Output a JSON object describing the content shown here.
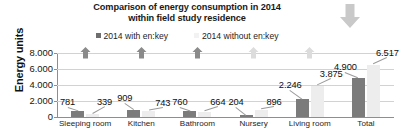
{
  "chart_data": {
    "type": "bar",
    "title": "Comparison of energy consumption in 2014 within field study residence",
    "title_line1": "Comparison of energy consumption in 2014",
    "title_line2": "within field study residence",
    "xlabel": "",
    "ylabel": "Energy units",
    "ylim": [
      0,
      8000
    ],
    "grid": true,
    "legend_position": "top-center",
    "categories": [
      "Sleeping room",
      "Kitchen",
      "Bathroom",
      "Nursery",
      "Living room",
      "Total"
    ],
    "ytick_labels": [
      "0",
      "2.000",
      "4.000",
      "6.000",
      "8.000"
    ],
    "ytick_values": [
      0,
      2000,
      4000,
      6000,
      8000
    ],
    "series": [
      {
        "name": "2014 with en:key",
        "color": "#7b7b7b",
        "values": [
          781,
          909,
          760,
          204,
          2246,
          4900
        ],
        "labels": [
          "781",
          "909",
          "760",
          "204",
          "2.246",
          "4.900"
        ]
      },
      {
        "name": "2014 without en:key",
        "color": "#ededed",
        "values": [
          339,
          743,
          664,
          896,
          3875,
          6517
        ],
        "labels": [
          "339",
          "743",
          "664",
          "896",
          "3.875",
          "6.517"
        ]
      }
    ],
    "annotations": {
      "up_arrows": [
        {
          "category": "Sleeping room",
          "shade": "dark"
        },
        {
          "category": "Kitchen",
          "shade": "dark"
        },
        {
          "category": "Bathroom",
          "shade": "dark"
        },
        {
          "category": "Nursery",
          "shade": "light"
        },
        {
          "category": "Living room",
          "shade": "light"
        }
      ],
      "corner_icon": "down-arrow"
    },
    "colors": {
      "series_dark": "#7b7b7b",
      "series_light": "#ededed",
      "grid": "#d2d2d2",
      "axis": "#8e8e8e",
      "text": "#111111",
      "arrow_dark": "#8a8a8a",
      "arrow_light": "#dcdcdc"
    }
  }
}
